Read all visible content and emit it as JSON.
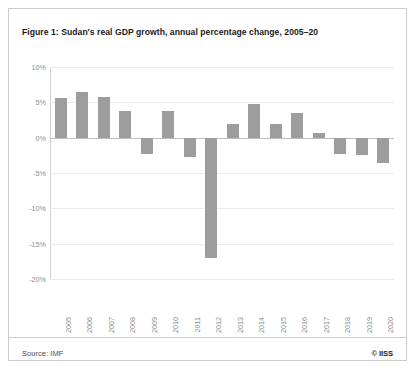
{
  "figure": {
    "title": "Figure 1: Sudan's real GDP growth, annual percentage change, 2005–20",
    "source_note": "Source: IMF",
    "copyright": "© IISS"
  },
  "colors": {
    "bar": "#9d9d9d",
    "gridline": "#ebebeb",
    "zero_line": "#bdbdbd",
    "axis": "#d2d2d2",
    "tick_text": "#8c8c8c",
    "title_text": "#1a1a1a",
    "panel_border": "#cccccc",
    "background": "#ffffff"
  },
  "chart_data": {
    "type": "bar",
    "title": "Figure 1: Sudan's real GDP growth, annual percentage change, 2005–20",
    "xlabel": "",
    "ylabel": "",
    "categories": [
      "2005",
      "2006",
      "2007",
      "2008",
      "2009",
      "2010",
      "2011",
      "2012",
      "2013",
      "2014",
      "2015",
      "2016",
      "2017",
      "2018",
      "2019",
      "2020"
    ],
    "values": [
      5.6,
      6.5,
      5.7,
      3.8,
      -2.3,
      3.8,
      -2.8,
      -17.0,
      2.0,
      4.7,
      1.9,
      3.5,
      0.7,
      -2.3,
      -2.5,
      -3.6
    ],
    "ylim": [
      -20,
      10
    ],
    "yticks": [
      10,
      5,
      0,
      -5,
      -10,
      -15,
      -20
    ],
    "ytick_labels": [
      "10%",
      "5%",
      "0%",
      "-5%",
      "-10%",
      "-15%",
      "-20%"
    ],
    "grid": true,
    "legend": false,
    "units": "percent"
  }
}
